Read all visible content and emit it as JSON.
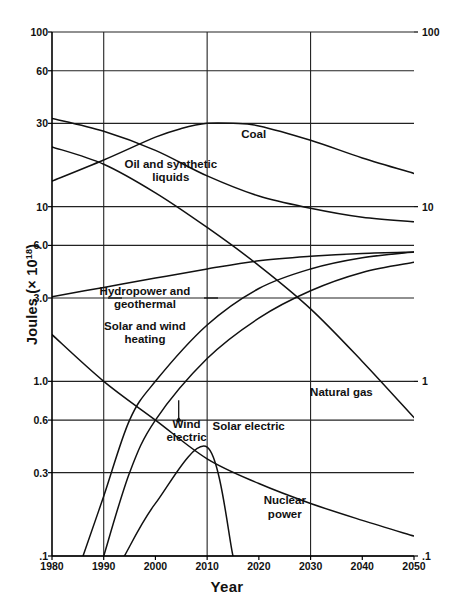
{
  "chart_data": {
    "type": "line",
    "title": "",
    "xlabel": "Year",
    "ylabel": "Joules (× 10¹⁸)",
    "ylabel_base": "Joules (× 10",
    "ylabel_exp": "18",
    "ylabel_close": ")",
    "yscale": "log",
    "xscale": "linear",
    "xlim": [
      1980,
      2050
    ],
    "ylim": [
      0.1,
      100
    ],
    "grid": true,
    "grid_note": "horizontal gridlines at each labeled y tick; vertical gridlines at 1990, 2010, 2030",
    "legend": "inline curve labels",
    "xticks": [
      "1980",
      "1990",
      "2000",
      "2010",
      "2020",
      "2030",
      "2040",
      "2050"
    ],
    "xtick_values": [
      1980,
      1990,
      2000,
      2010,
      2020,
      2030,
      2040,
      2050
    ],
    "yticks_left": [
      "100",
      "60",
      "30",
      "10",
      "6.0",
      "3.0",
      "1.0",
      "0.6",
      "0.3",
      ".1"
    ],
    "ytick_values": [
      100,
      60,
      30,
      10,
      6.0,
      3.0,
      1.0,
      0.6,
      0.3,
      0.1
    ],
    "yticks_right": [
      "100",
      "10",
      "1",
      ".1"
    ],
    "ytick_right_values": [
      100,
      10,
      1,
      0.1
    ],
    "gridlines_vertical": [
      1990,
      2010,
      2030
    ],
    "series": [
      {
        "name": "Coal",
        "label": "Coal",
        "x": [
          1980,
          1990,
          2000,
          2005,
          2010,
          2015,
          2020,
          2030,
          2040,
          2050
        ],
        "values": [
          14.0,
          18.5,
          25.0,
          28.0,
          30.0,
          30.0,
          29.0,
          24.0,
          19.0,
          15.5
        ]
      },
      {
        "name": "Oil and synthetic liquids",
        "label": "Oil and synthetic\nliquids",
        "x": [
          1980,
          1990,
          2000,
          2010,
          2020,
          2030,
          2040,
          2050
        ],
        "values": [
          32.0,
          27.0,
          21.0,
          15.0,
          11.5,
          9.8,
          8.7,
          8.2
        ]
      },
      {
        "name": "Natural gas",
        "label": "Natural gas",
        "x": [
          1980,
          1990,
          2000,
          2010,
          2020,
          2030,
          2040,
          2050
        ],
        "values": [
          22.0,
          17.5,
          12.0,
          7.6,
          4.6,
          2.6,
          1.3,
          0.62
        ]
      },
      {
        "name": "Hydropower and geothermal",
        "label": "Hydropower and\ngeothermal",
        "x": [
          1980,
          1990,
          2000,
          2010,
          2020,
          2030,
          2040,
          2050
        ],
        "values": [
          3.05,
          3.45,
          3.9,
          4.4,
          4.9,
          5.2,
          5.4,
          5.5
        ]
      },
      {
        "name": "Solar and wind heating",
        "label": "Solar and wind\nheating",
        "x": [
          1980,
          1990,
          2000,
          2010,
          2020,
          2030,
          2040,
          2050
        ],
        "values": [
          1.85,
          1.0,
          0.6,
          0.36,
          0.26,
          0.2,
          0.16,
          0.13
        ]
      },
      {
        "name": "Wind electric",
        "label": "Wind\nelectric",
        "x": [
          1986,
          1990,
          1995,
          2000,
          2010,
          2020,
          2030,
          2040,
          2050
        ],
        "values": [
          0.1,
          0.22,
          0.6,
          1.0,
          2.1,
          3.4,
          4.4,
          5.1,
          5.5
        ]
      },
      {
        "name": "Solar electric",
        "label": "Solar electric",
        "x": [
          1990,
          1995,
          2000,
          2010,
          2020,
          2030,
          2040,
          2050
        ],
        "values": [
          0.1,
          0.3,
          0.6,
          1.35,
          2.3,
          3.3,
          4.2,
          4.8
        ]
      },
      {
        "name": "Nuclear power",
        "label": "Nuclear\npower",
        "x": [
          1994,
          2000,
          2010,
          2015
        ],
        "values": [
          0.1,
          0.2,
          0.42,
          0.1
        ]
      }
    ],
    "annotations": [
      {
        "text": "Coal",
        "x": 2019,
        "y": 26
      },
      {
        "text": "Oil and synthetic\nliquids",
        "x": 2003,
        "y": 16
      },
      {
        "text": "Hydropower and\ngeothermal",
        "x": 1998,
        "y": 3.0
      },
      {
        "text": "Solar and wind\nheating",
        "x": 1998,
        "y": 1.9
      },
      {
        "text": "Wind\nelectric",
        "x": 2006,
        "y": 0.52
      },
      {
        "text": "Solar electric",
        "x": 2018,
        "y": 0.55
      },
      {
        "text": "Natural gas",
        "x": 2036,
        "y": 0.86
      },
      {
        "text": "Nuclear\npower",
        "x": 2025,
        "y": 0.19
      }
    ],
    "colors": {
      "curve": "#111111",
      "grid": "#222222",
      "axis": "#000000",
      "background": "#ffffff",
      "text": "#111111"
    }
  }
}
